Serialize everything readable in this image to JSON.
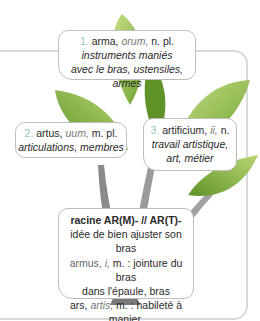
{
  "colors": {
    "leaf_dark": "#7cae3a",
    "leaf_light": "#b5d46a",
    "trunk": "#8a8a8a",
    "number_accent": "#8fc9b8",
    "frame": "#d9d9d9"
  },
  "box1": {
    "number": "1.",
    "word": "arma,",
    "ending": "orum,",
    "grammar": "n. pl.",
    "line2": "instruments maniés",
    "line3": "avec le bras, ustensiles, armes"
  },
  "box2": {
    "number": "2.",
    "word": "artus,",
    "ending": "uum,",
    "grammar": "m. pl.",
    "line2": "articulations, membres"
  },
  "box3": {
    "number": "3.",
    "word": "artificium,",
    "ending": "ii,",
    "grammar": "n.",
    "line2": "travail artistique,",
    "line3": "art, métier"
  },
  "root": {
    "title": "racine AR(M)-  // AR(T)-",
    "line1": "idée de bien ajuster son bras",
    "armus_word": "armus,",
    "armus_ending": "i,",
    "armus_def": "m. : jointure du bras",
    "armus_def2": "dans l'épaule, bras",
    "ars_word": "ars,",
    "ars_ending": "artis,",
    "ars_def": "m. : habileté à manier,",
    "ars_def2": "métier, art"
  }
}
